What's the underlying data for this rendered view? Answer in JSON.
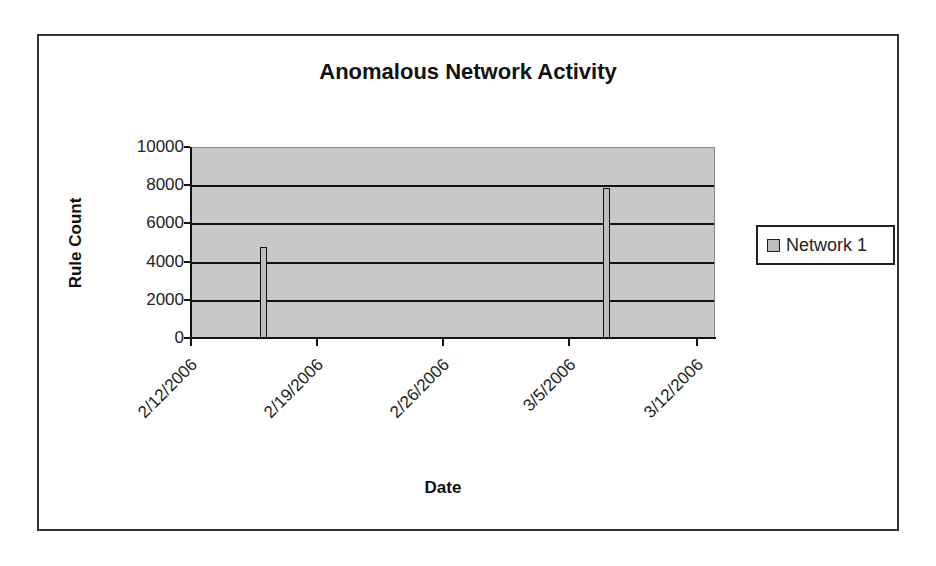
{
  "chart_data": {
    "type": "bar",
    "title": "Anomalous Network Activity",
    "xlabel": "Date",
    "ylabel": "Rule Count",
    "ylim": [
      0,
      10000
    ],
    "yticks": [
      0,
      2000,
      4000,
      6000,
      8000,
      10000
    ],
    "xticks": [
      "2/12/2006",
      "2/19/2006",
      "2/26/2006",
      "3/5/2006",
      "3/12/2006"
    ],
    "grid": true,
    "legend_position": "right",
    "plot_background": "#c8c8c8",
    "series": [
      {
        "name": "Network 1",
        "color": "#bdbdbd",
        "x": [
          "2/16/2006",
          "3/7/2006"
        ],
        "values": [
          4750,
          7850
        ]
      }
    ]
  },
  "title": "Anomalous Network Activity",
  "axes": {
    "ylabel": "Rule Count",
    "xlabel": "Date",
    "ytick_labels": [
      "0",
      "2000",
      "4000",
      "6000",
      "8000",
      "10000"
    ],
    "xtick_labels": [
      "2/12/2006",
      "2/19/2006",
      "2/26/2006",
      "3/5/2006",
      "3/12/2006"
    ]
  },
  "legend": {
    "items": [
      {
        "label": "Network 1"
      }
    ]
  }
}
